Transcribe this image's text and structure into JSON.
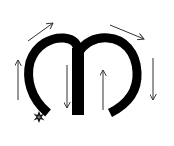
{
  "diagram": {
    "title": "Letter m stroke direction",
    "glyph": "m",
    "colors": {
      "background": "#ffffff",
      "glyph": "#000000",
      "arrow": "#333333",
      "start_marker": "#111111"
    },
    "start_marker": {
      "icon": "star-burst",
      "x": 39,
      "y": 117
    },
    "arrows": [
      {
        "id": "left-up",
        "direction": "up",
        "from": [
          18,
          100
        ],
        "to": [
          18,
          60
        ]
      },
      {
        "id": "top-left-diagonal",
        "direction": "up-right",
        "from": [
          28,
          41
        ],
        "to": [
          53,
          23
        ]
      },
      {
        "id": "inner-down",
        "direction": "down",
        "from": [
          67,
          65
        ],
        "to": [
          67,
          108
        ]
      },
      {
        "id": "inner-up",
        "direction": "up",
        "from": [
          103,
          110
        ],
        "to": [
          103,
          70
        ]
      },
      {
        "id": "top-right-diagonal",
        "direction": "down-right",
        "from": [
          110,
          25
        ],
        "to": [
          144,
          39
        ]
      },
      {
        "id": "right-down",
        "direction": "down",
        "from": [
          153,
          58
        ],
        "to": [
          153,
          100
        ]
      }
    ]
  }
}
